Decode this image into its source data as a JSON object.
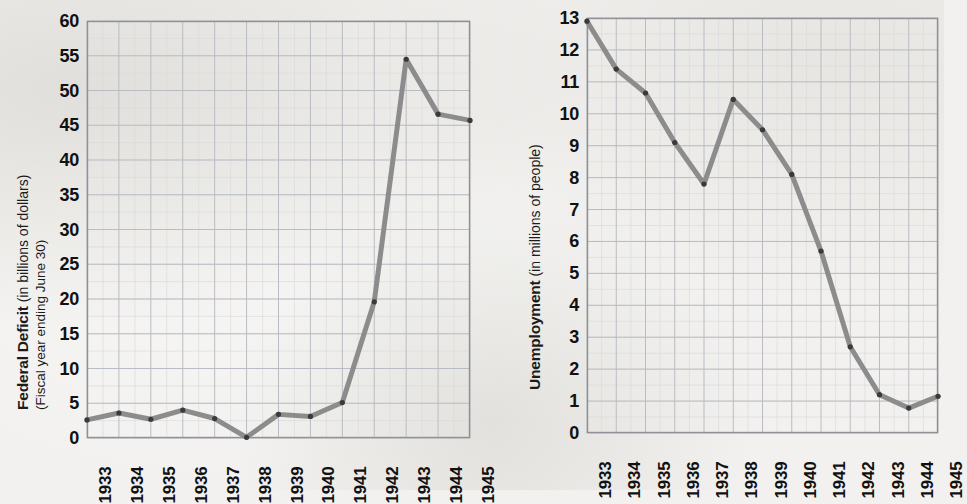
{
  "page": {
    "background_color": "#f2f1ef",
    "line_color": "#8c8c8c",
    "line_color_dark": "#6f6f6f",
    "marker_color": "#3a3a3a",
    "grid_major_color": "#b9bcc2",
    "grid_minor_color": "#d9dbde",
    "axis_color": "#8f9196",
    "text_color": "#111111"
  },
  "charts": [
    {
      "id": "federal-deficit",
      "name": "federal-deficit-chart",
      "axis_title_bold": "Federal Deficit",
      "axis_title_regular": " (in billions of dollars)",
      "axis_title_sub": "(Fiscal year ending June 30)",
      "plot": {
        "x": 87,
        "y": 21,
        "width": 383,
        "height": 417
      },
      "yticks": [
        "0",
        "5",
        "10",
        "15",
        "20",
        "25",
        "30",
        "35",
        "40",
        "45",
        "50",
        "55",
        "60"
      ],
      "xticks": [
        "1933",
        "1934",
        "1935",
        "1936",
        "1937",
        "1938",
        "1939",
        "1940",
        "1941",
        "1942",
        "1943",
        "1944",
        "1945"
      ],
      "chart_data": {
        "type": "line",
        "title": "Federal Deficit (in billions of dollars)",
        "subtitle": "Fiscal year ending June 30",
        "xlabel": "",
        "ylabel": "Federal Deficit (in billions of dollars)",
        "categories": [
          "1933",
          "1934",
          "1935",
          "1936",
          "1937",
          "1938",
          "1939",
          "1940",
          "1941",
          "1942",
          "1943",
          "1944",
          "1945"
        ],
        "values": [
          2.6,
          3.6,
          2.7,
          4.0,
          2.8,
          0.1,
          3.4,
          3.1,
          5.1,
          19.6,
          54.5,
          46.6,
          45.7
        ],
        "ylim": [
          0,
          60
        ],
        "ytick_step": 5,
        "minor_gridlines": true,
        "grid": true,
        "legend": "none",
        "markers": true
      }
    },
    {
      "id": "unemployment",
      "name": "unemployment-chart",
      "axis_title_bold": "Unemployment",
      "axis_title_regular": " (in millions of people)",
      "axis_title_sub": "",
      "plot": {
        "x": 107,
        "y": 18,
        "width": 351,
        "height": 415
      },
      "yticks": [
        "0",
        "1",
        "2",
        "3",
        "4",
        "5",
        "6",
        "7",
        "8",
        "9",
        "10",
        "11",
        "12",
        "13"
      ],
      "xticks": [
        "1933",
        "1934",
        "1935",
        "1936",
        "1937",
        "1938",
        "1939",
        "1940",
        "1941",
        "1942",
        "1943",
        "1944",
        "1945"
      ],
      "chart_data": {
        "type": "line",
        "title": "Unemployment (in millions of people)",
        "subtitle": "",
        "xlabel": "",
        "ylabel": "Unemployment (in millions of people)",
        "categories": [
          "1933",
          "1934",
          "1935",
          "1936",
          "1937",
          "1938",
          "1939",
          "1940",
          "1941",
          "1942",
          "1943",
          "1944",
          "1945"
        ],
        "values": [
          12.9,
          11.4,
          10.65,
          9.1,
          7.8,
          10.45,
          9.5,
          8.1,
          5.7,
          2.7,
          1.2,
          0.78,
          1.15
        ],
        "ylim": [
          0,
          13
        ],
        "ytick_step": 1,
        "minor_gridlines": true,
        "grid": true,
        "legend": "none",
        "markers": true
      }
    }
  ]
}
